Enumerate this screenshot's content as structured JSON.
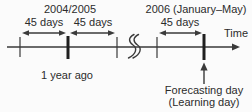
{
  "colors": {
    "bg": "#fbfbfb",
    "line": "#3a3a3a",
    "tickBold": "#1f1f1f",
    "text": "#2b2b2b"
  },
  "timeline": {
    "periods": [
      {
        "label": "2004/2005"
      },
      {
        "label": "2006 (January–May)"
      }
    ],
    "intervals": [
      {
        "label": "45 days"
      },
      {
        "label": "45 days"
      },
      {
        "label": "45 days"
      }
    ],
    "axis_label": "Time",
    "past_label": "1 year ago",
    "annotation": {
      "line1": "Forecasting day",
      "line2": "(Learning day)"
    }
  }
}
